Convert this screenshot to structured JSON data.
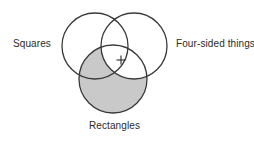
{
  "diagram": {
    "type": "venn-3-circle",
    "title": "",
    "background_color": "#ffffff",
    "stroke_color": "#3a3a3a",
    "stroke_width": 1.3,
    "shaded_fill_color": "#c9c9c9",
    "unshaded_fill_color": "#ffffff",
    "text_color": "#2b2b2b",
    "sets": [
      {
        "id": "squares",
        "label": "Squares",
        "label_position": "left",
        "cx": 95,
        "cy": 46,
        "r": 33,
        "filled": false
      },
      {
        "id": "four-sided-things",
        "label": "Four-sided things",
        "label_position": "right",
        "cx": 134,
        "cy": 46,
        "r": 33,
        "filled": false
      },
      {
        "id": "rectangles",
        "label": "Rectangles",
        "label_position": "bottom",
        "cx": 113,
        "cy": 79,
        "r": 34,
        "filled": true
      }
    ],
    "marks": [
      {
        "id": "center-plus",
        "glyph": "+",
        "x": 121,
        "y": 60,
        "size": 9,
        "description": "plus mark in the triple intersection region"
      }
    ],
    "shading_note": "Rectangles circle is gray-filled except the portion that lies inside the Four-sided things circle, which is white."
  }
}
